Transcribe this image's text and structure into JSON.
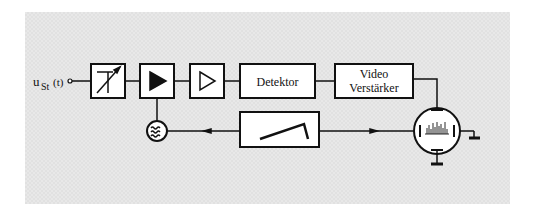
{
  "diagram": {
    "input_label": {
      "main": "u",
      "subscript": "St",
      "suffix": "(t)"
    },
    "blocks": [
      {
        "id": "attenuator",
        "symbol": "variable-attenuator",
        "label": ""
      },
      {
        "id": "mixer-amp",
        "symbol": "filled-triangle",
        "label": ""
      },
      {
        "id": "if-amp",
        "symbol": "open-triangle",
        "label": ""
      },
      {
        "id": "detector",
        "symbol": "text",
        "label": "Detektor"
      },
      {
        "id": "video-amp",
        "symbol": "text",
        "label_line1": "Video",
        "label_line2": "Verstärker"
      },
      {
        "id": "sweep-generator",
        "symbol": "sawtooth",
        "label": ""
      },
      {
        "id": "local-oscillator",
        "symbol": "tilde-circle",
        "label": ""
      },
      {
        "id": "crt",
        "symbol": "cathode-ray-tube",
        "label": ""
      }
    ],
    "colors": {
      "background": "#e8e8e8",
      "stroke": "#111111",
      "box_fill": "#ffffff"
    }
  }
}
